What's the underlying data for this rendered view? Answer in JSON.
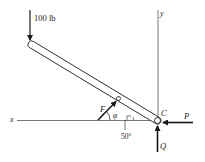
{
  "diagram": {
    "type": "statics free-body diagram",
    "labels": {
      "load": "100 lb",
      "x_axis": "x",
      "y_axis": "y",
      "force_F": "F",
      "angle_phi": "φ",
      "angle_value": "50°",
      "point_C": "C",
      "force_P": "P",
      "force_Q": "Q"
    },
    "colors": {
      "ink": "#1a1a1a",
      "axis": "#555555",
      "background": "#ffffff"
    }
  }
}
